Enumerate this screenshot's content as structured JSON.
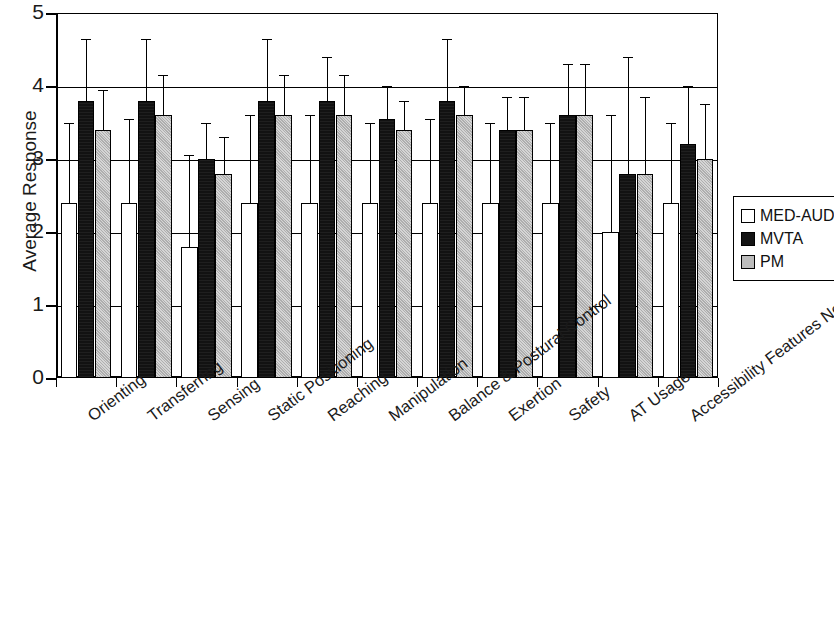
{
  "chart_data": {
    "type": "bar",
    "title": "",
    "xlabel": "",
    "ylabel": "Average Response",
    "ylim": [
      0,
      5
    ],
    "yticks": [
      0,
      1,
      2,
      3,
      4,
      5
    ],
    "ytick_labels": [
      "0",
      "1",
      "2",
      "3",
      "4",
      "5"
    ],
    "grid": true,
    "grid_axis": "y",
    "legend_position": "right",
    "error_bars": "asymmetric-upper (standard deviation, upper whisker shown)",
    "categories": [
      "Orienting",
      "Transferring",
      "Sensing",
      "Static Positioning",
      "Reaching",
      "Manipulation",
      "Balance & Postural Control",
      "Exertion",
      "Safety",
      "AT Usage",
      "Accessibility Features Needed"
    ],
    "series": [
      {
        "name": "MED-AUDIT",
        "color": "#ffffff",
        "values": [
          2.4,
          2.4,
          1.8,
          2.4,
          2.4,
          2.4,
          2.4,
          2.4,
          2.4,
          2.0,
          2.4
        ],
        "error_upper": [
          3.5,
          3.55,
          3.05,
          3.6,
          3.6,
          3.5,
          3.55,
          3.5,
          3.5,
          3.6,
          3.5
        ]
      },
      {
        "name": "MVTA",
        "color": "#121212",
        "values": [
          3.8,
          3.8,
          3.0,
          3.8,
          3.8,
          3.55,
          3.8,
          3.4,
          3.6,
          2.8,
          3.2
        ],
        "error_upper": [
          4.65,
          4.65,
          3.5,
          4.65,
          4.4,
          4.0,
          4.65,
          3.85,
          4.3,
          4.4,
          4.0
        ]
      },
      {
        "name": "PM",
        "color": "#b9b9b9",
        "values": [
          3.4,
          3.6,
          2.8,
          3.6,
          3.6,
          3.4,
          3.6,
          3.4,
          3.6,
          2.8,
          3.0
        ],
        "error_upper": [
          3.95,
          4.15,
          3.3,
          4.15,
          4.15,
          3.8,
          4.0,
          3.85,
          4.3,
          3.85,
          3.75
        ]
      }
    ]
  },
  "legend": {
    "items": [
      {
        "label": "MED-AUDIT"
      },
      {
        "label": "MVTA"
      },
      {
        "label": "PM"
      }
    ]
  },
  "axis": {
    "y_title": "Average Response"
  }
}
